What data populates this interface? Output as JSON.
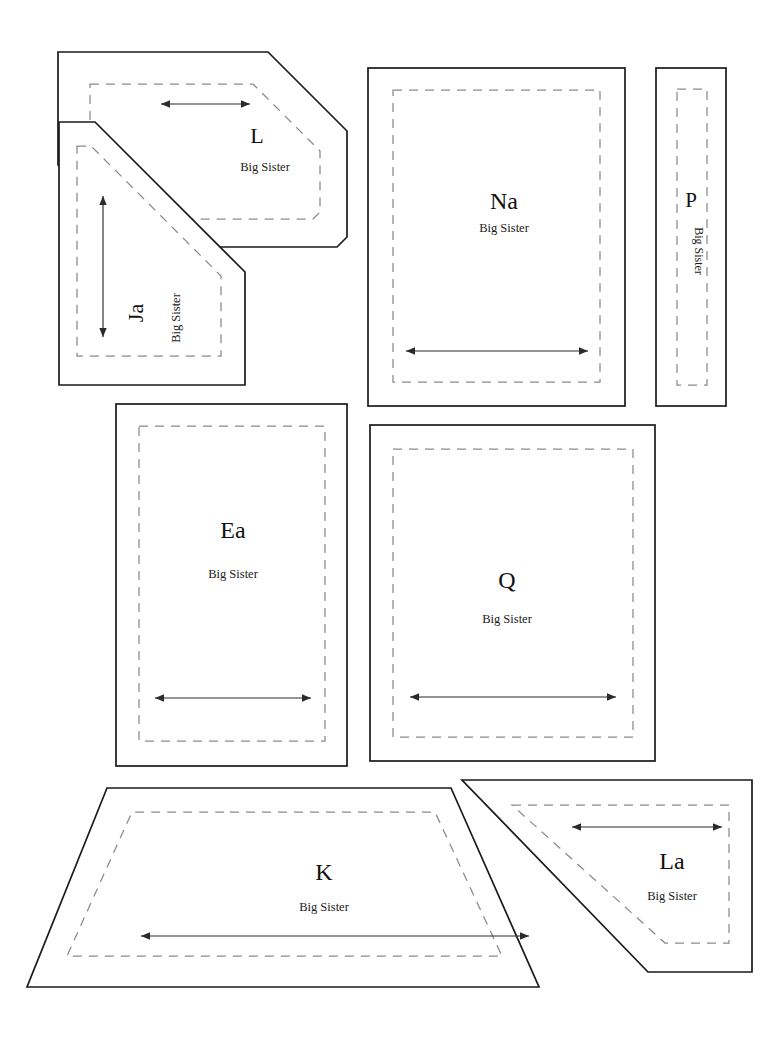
{
  "sheet": {
    "title": "Big Sister pattern pieces layout sheet",
    "background_color": "#ffffff",
    "cutline_color": "#1a1a1a",
    "seamline_color": "#8a8a8a",
    "grainline_color": "#2b2b2b",
    "width": 772,
    "height": 1053
  },
  "pieces": [
    {
      "id": "L",
      "letter": "L",
      "brand": "Big Sister",
      "shape": "angled-hexagon",
      "grainline": "horizontal",
      "text_orientation": "upright"
    },
    {
      "id": "Ja",
      "letter": "Ja",
      "brand": "Big Sister",
      "shape": "clipped-triangle",
      "grainline": "vertical",
      "text_orientation": "rotated-90-ccw"
    },
    {
      "id": "Na",
      "letter": "Na",
      "brand": "Big Sister",
      "shape": "rectangle",
      "grainline": "horizontal",
      "text_orientation": "upright"
    },
    {
      "id": "P",
      "letter": "P",
      "brand": "Big Sister",
      "shape": "narrow-rectangle",
      "grainline": "none",
      "text_orientation": "brand-rotated-90-cw"
    },
    {
      "id": "Ea",
      "letter": "Ea",
      "brand": "Big Sister",
      "shape": "rectangle",
      "grainline": "horizontal",
      "text_orientation": "upright"
    },
    {
      "id": "Q",
      "letter": "Q",
      "brand": "Big Sister",
      "shape": "rectangle",
      "grainline": "horizontal",
      "text_orientation": "upright"
    },
    {
      "id": "K",
      "letter": "K",
      "brand": "Big Sister",
      "shape": "trapezoid",
      "grainline": "horizontal",
      "text_orientation": "upright"
    },
    {
      "id": "La",
      "letter": "La",
      "brand": "Big Sister",
      "shape": "clipped-corner-rectangle",
      "grainline": "horizontal",
      "text_orientation": "upright"
    }
  ]
}
